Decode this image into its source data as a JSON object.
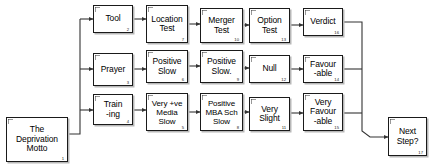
{
  "diagram": {
    "type": "flowchart",
    "background_color": "#ffffff",
    "line_color": "#333333",
    "box_border_color": "#1a1a1a",
    "box_fill_color": "#ffffff",
    "shadow_color": "#b8b8b8",
    "nodes": [
      {
        "id": "n1",
        "number": "1",
        "label": "The\nDeprivation\nMotto",
        "x": 6,
        "y": 117,
        "w": 62,
        "h": 45
      },
      {
        "id": "n2",
        "number": "2",
        "label": "Tool",
        "x": 93,
        "y": 5,
        "w": 40,
        "h": 28
      },
      {
        "id": "n3",
        "number": "3",
        "label": "Prayer",
        "x": 93,
        "y": 53,
        "w": 40,
        "h": 33
      },
      {
        "id": "n4",
        "number": "4",
        "label": "Train\n-ing",
        "x": 93,
        "y": 94,
        "w": 40,
        "h": 31
      },
      {
        "id": "n5",
        "number": "5",
        "label": "Very +ve\nMedia\nSlow",
        "x": 146,
        "y": 93,
        "w": 42,
        "h": 38
      },
      {
        "id": "n6",
        "number": "6",
        "label": "Positive\nSlow",
        "x": 146,
        "y": 50,
        "w": 42,
        "h": 33
      },
      {
        "id": "n7",
        "number": "7",
        "label": "Location\nTest",
        "x": 146,
        "y": 5,
        "w": 42,
        "h": 38
      },
      {
        "id": "n8",
        "number": "8",
        "label": "Positive\nMBA Sch\nSlow",
        "x": 200,
        "y": 93,
        "w": 43,
        "h": 38
      },
      {
        "id": "n9",
        "number": "9",
        "label": "Positive\nSlow.",
        "x": 200,
        "y": 50,
        "w": 43,
        "h": 33
      },
      {
        "id": "n10",
        "number": "10",
        "label": "Merger\nTest",
        "x": 200,
        "y": 8,
        "w": 43,
        "h": 35
      },
      {
        "id": "n11",
        "number": "11",
        "label": "Very\nSlight",
        "x": 249,
        "y": 97,
        "w": 41,
        "h": 34
      },
      {
        "id": "n12",
        "number": "12",
        "label": "Null",
        "x": 249,
        "y": 55,
        "w": 41,
        "h": 28
      },
      {
        "id": "n13",
        "number": "13",
        "label": "Option\nTest",
        "x": 249,
        "y": 8,
        "w": 41,
        "h": 35
      },
      {
        "id": "n14",
        "number": "14",
        "label": "Favour\n-able",
        "x": 303,
        "y": 55,
        "w": 40,
        "h": 28
      },
      {
        "id": "n15",
        "number": "15",
        "label": "Very\nFavour\n-able",
        "x": 303,
        "y": 93,
        "w": 40,
        "h": 38
      },
      {
        "id": "n16",
        "number": "16",
        "label": "Verdict",
        "x": 303,
        "y": 8,
        "w": 40,
        "h": 28
      },
      {
        "id": "n17",
        "number": "17",
        "label": "Next\nStep?",
        "x": 388,
        "y": 117,
        "w": 39,
        "h": 39
      }
    ],
    "edges": [
      {
        "from": "n1",
        "to": "n2",
        "kind": "fan-out-top"
      },
      {
        "from": "n1",
        "to": "n3",
        "kind": "fan-out-mid"
      },
      {
        "from": "n1",
        "to": "n4",
        "kind": "fan-out-bottom"
      },
      {
        "from": "n2",
        "to": "n7",
        "kind": "straight"
      },
      {
        "from": "n7",
        "to": "n10",
        "kind": "straight"
      },
      {
        "from": "n10",
        "to": "n13",
        "kind": "straight"
      },
      {
        "from": "n13",
        "to": "n16",
        "kind": "straight"
      },
      {
        "from": "n3",
        "to": "n6",
        "kind": "straight"
      },
      {
        "from": "n6",
        "to": "n9",
        "kind": "straight"
      },
      {
        "from": "n9",
        "to": "n12",
        "kind": "straight"
      },
      {
        "from": "n12",
        "to": "n14",
        "kind": "straight"
      },
      {
        "from": "n4",
        "to": "n5",
        "kind": "straight"
      },
      {
        "from": "n5",
        "to": "n8",
        "kind": "straight"
      },
      {
        "from": "n8",
        "to": "n11",
        "kind": "straight"
      },
      {
        "from": "n11",
        "to": "n15",
        "kind": "straight"
      },
      {
        "from": "n16",
        "to": "n17",
        "kind": "fan-in-top"
      },
      {
        "from": "n14",
        "to": "n17",
        "kind": "fan-in-mid"
      },
      {
        "from": "n15",
        "to": "n17",
        "kind": "fan-in-bottom"
      }
    ]
  }
}
